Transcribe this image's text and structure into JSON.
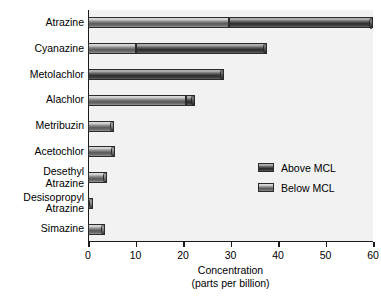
{
  "chart_data": {
    "type": "bar",
    "orientation": "horizontal",
    "title": "",
    "xlabel": "Concentration",
    "xlabel_sub": "(parts per billion)",
    "ylabel": "",
    "xlim": [
      0,
      60
    ],
    "xticks": [
      0,
      10,
      20,
      30,
      40,
      50,
      60
    ],
    "xticklabels": [
      "0",
      "10",
      "20",
      "30",
      "40",
      "50",
      "60"
    ],
    "grid": false,
    "legend_position": "center-right",
    "categories": [
      "Atrazine",
      "Cyanazine",
      "Metolachlor",
      "Alachlor",
      "Metribuzin",
      "Acetochlor",
      "Desethyl\nAtrazine",
      "Desisopropyl\nAtrazine",
      "Simazine"
    ],
    "series": [
      {
        "name": "Below MCL",
        "color": "#8f8f8f",
        "values": [
          29.6,
          10.2,
          0,
          20.7,
          5.5,
          5.6,
          4.0,
          1.0,
          3.6
        ]
      },
      {
        "name": "Above MCL",
        "color": "#2e2e2e",
        "values": [
          30.4,
          27.4,
          28.7,
          1.9,
          0,
          0,
          0,
          0,
          0
        ]
      }
    ],
    "totals": [
      60.0,
      37.6,
      28.7,
      22.6,
      5.5,
      5.6,
      4.0,
      1.0,
      3.6
    ]
  },
  "legend": {
    "items": [
      {
        "label": "Above MCL",
        "swatch": "above"
      },
      {
        "label": "Below MCL",
        "swatch": "below"
      }
    ]
  },
  "colors": {
    "plot_background": "#f2f2f2",
    "page_background": "#ffffff",
    "axis": "#1a1a1a",
    "text": "#000000",
    "above_mcl": "#2e2e2e",
    "below_mcl": "#8f8f8f"
  }
}
